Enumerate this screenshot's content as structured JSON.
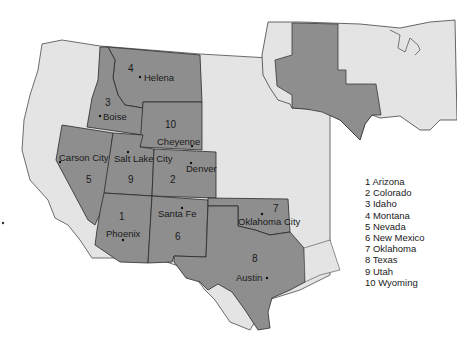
{
  "map": {
    "colors": {
      "background": "#ffffff",
      "land": "#e4e4e4",
      "highlight": "#8e8e8e",
      "border": "#2a2a2a"
    },
    "states": [
      {
        "id": 1,
        "name": "Arizona",
        "capital": "Phoenix"
      },
      {
        "id": 2,
        "name": "Colorado",
        "capital": "Denver"
      },
      {
        "id": 3,
        "name": "Idaho",
        "capital": "Boise"
      },
      {
        "id": 4,
        "name": "Montana",
        "capital": "Helena"
      },
      {
        "id": 5,
        "name": "Nevada",
        "capital": "Carson City"
      },
      {
        "id": 6,
        "name": "New Mexico",
        "capital": "Santa Fe"
      },
      {
        "id": 7,
        "name": "Oklahoma",
        "capital": "Oklahoma City"
      },
      {
        "id": 8,
        "name": "Texas",
        "capital": "Austin"
      },
      {
        "id": 9,
        "name": "Utah",
        "capital": "Salt Lake City"
      },
      {
        "id": 10,
        "name": "Wyoming",
        "capital": "Cheyenne"
      }
    ],
    "labels": {
      "n1": "1",
      "n2": "2",
      "n3": "3",
      "n4": "4",
      "n5": "5",
      "n6": "6",
      "n7": "7",
      "n8": "8",
      "n9": "9",
      "n10": "10",
      "phoenix": "Phoenix",
      "denver": "Denver",
      "boise": "Boise",
      "helena": "Helena",
      "carson": "Carson City",
      "santafe": "Santa Fe",
      "okc": "Oklahoma City",
      "austin": "Austin",
      "slc": "Salt Lake City",
      "cheyenne": "Cheyenne"
    },
    "legend": [
      "1 Arizona",
      "2 Colorado",
      "3 Idaho",
      "4 Montana",
      "5 Nevada",
      "6 New Mexico",
      "7 Oklahoma",
      "8 Texas",
      "9 Utah",
      "10 Wyoming"
    ],
    "inset": {
      "description": "Inset map of contiguous United States with highlighted region"
    }
  }
}
